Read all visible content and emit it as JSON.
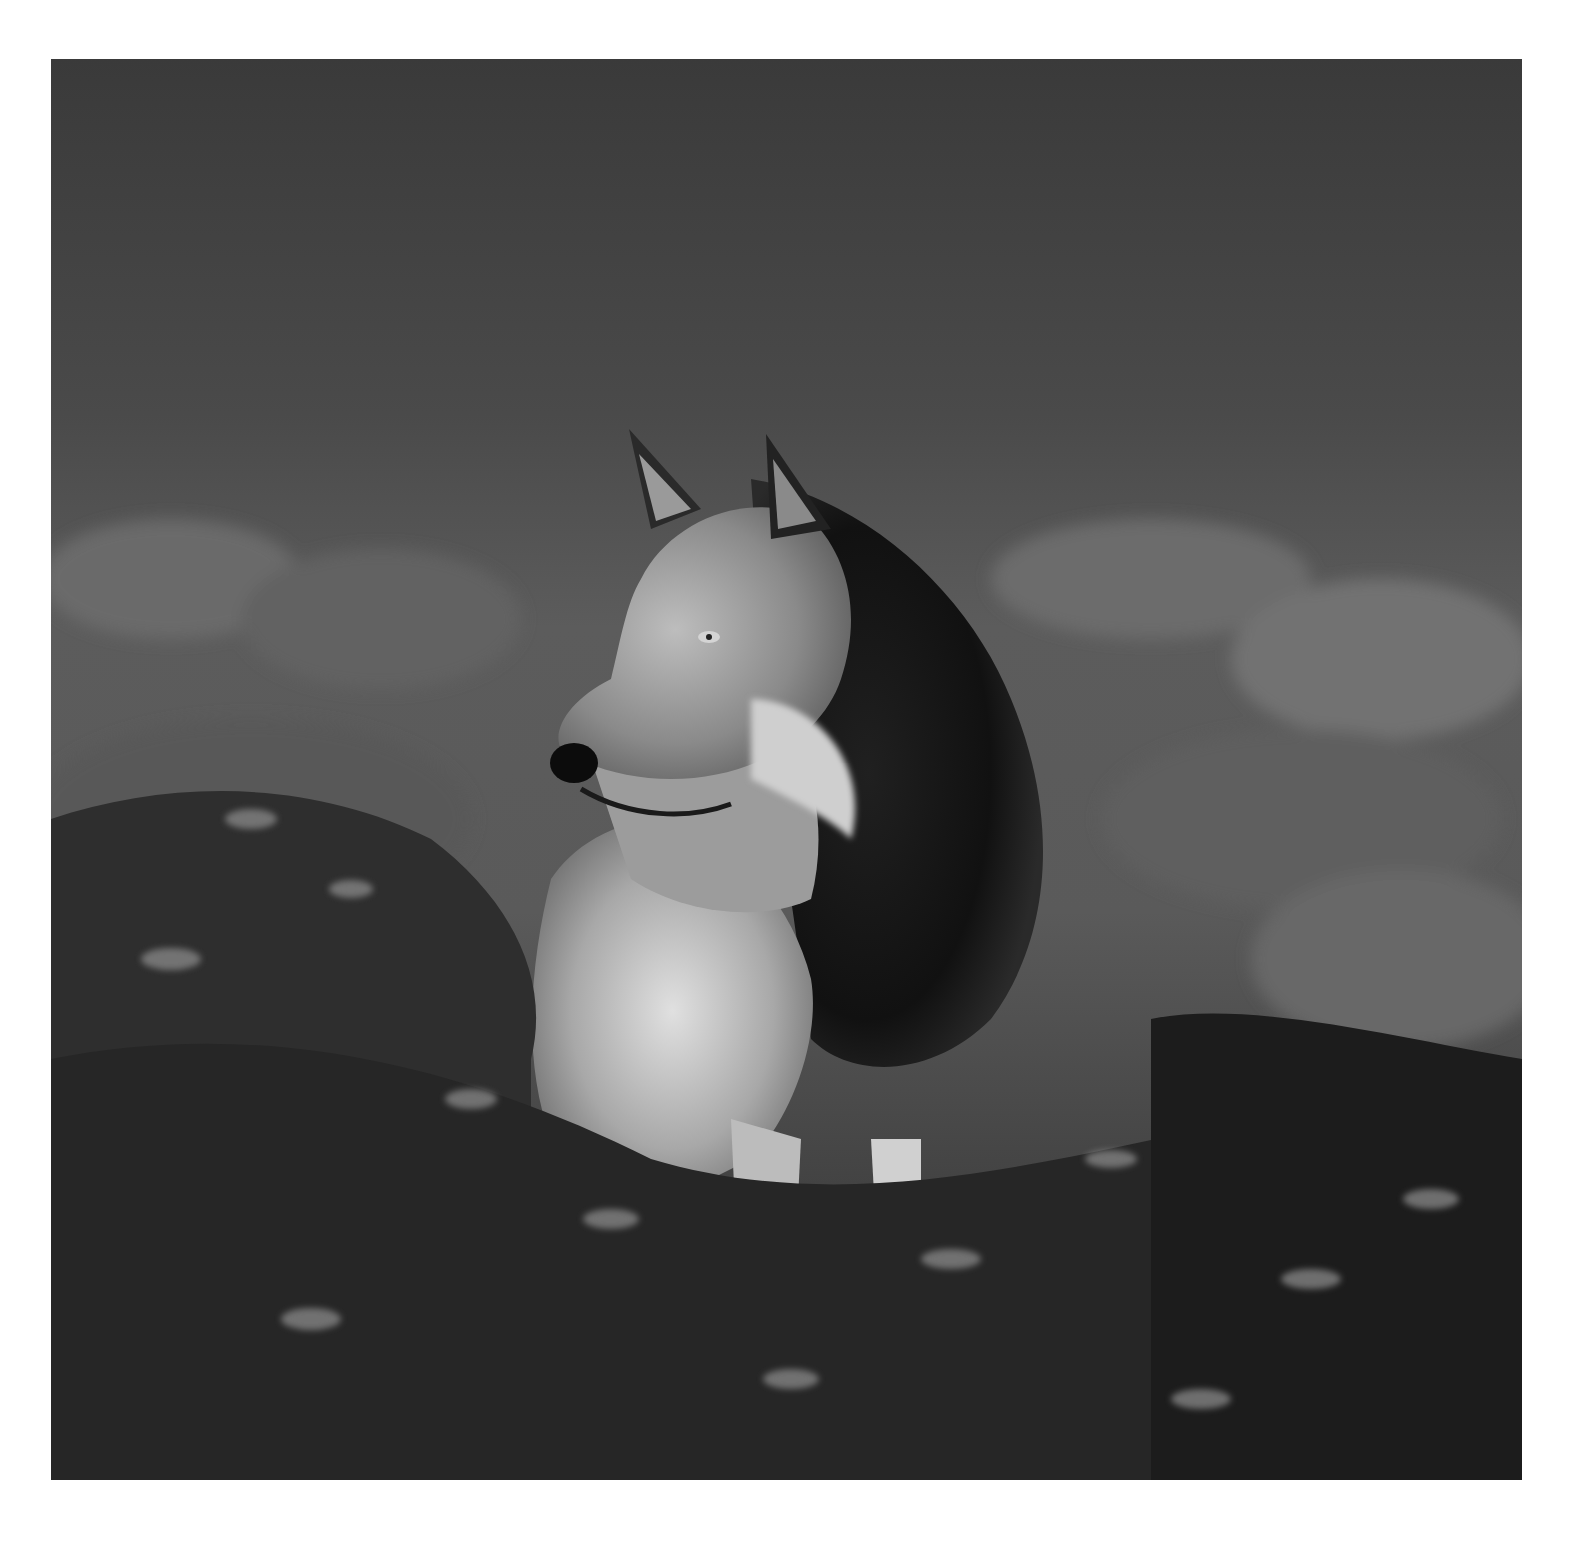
{
  "image": {
    "kind": "photograph",
    "subject": "gray wolf standing in brush",
    "tone": "grayscale",
    "border_color": "#ffffff",
    "photo_bounds": {
      "x": 51,
      "y": 59,
      "width": 1471,
      "height": 1421
    },
    "palette": {
      "sky_dark": "#3b3b3b",
      "sky_mid": "#5a5a5a",
      "brush_mid": "#6e6e6e",
      "brush_dark": "#1c1c1c",
      "fur_light": "#d8d8d8",
      "fur_mid": "#9a9a9a",
      "fur_dark": "#151515"
    }
  }
}
